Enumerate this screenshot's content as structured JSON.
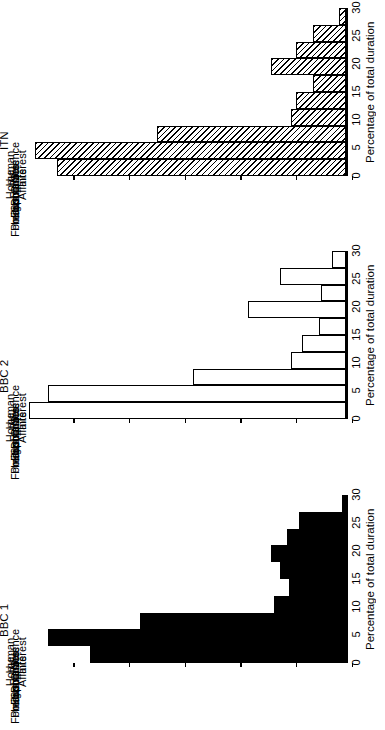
{
  "figure": {
    "orientation": "rotated-90",
    "value_axis_title": "Percentage of total duration",
    "tick_labels": [
      "0",
      "5",
      "10",
      "15",
      "20",
      "25",
      "30"
    ],
    "tick_values": [
      0,
      5,
      10,
      15,
      20,
      25,
      30
    ],
    "axis_max": 30,
    "categories": [
      "Science",
      "Human\nInterest",
      "Crime",
      "Home\nAffairs",
      "Disasters",
      "Sport",
      "Economics",
      "Industrial",
      "Politics",
      "Foreign"
    ]
  },
  "panels": [
    {
      "title": "ITN",
      "fill": "hatch",
      "color": "#000000"
    },
    {
      "title": "BBC 2",
      "fill": "open",
      "color": "#000000"
    },
    {
      "title": "BBC 1",
      "fill": "solid",
      "color": "#000000"
    }
  ],
  "chart_data": {
    "type": "bar",
    "title": "",
    "subtitle": "",
    "xlabel": "",
    "ylabel": "Percentage of total duration",
    "ylim": [
      0,
      30
    ],
    "yticks": [
      0,
      5,
      10,
      15,
      20,
      25,
      30
    ],
    "grid": false,
    "legend": "none",
    "orientation": "horizontal-rotated",
    "panels": [
      "ITN",
      "BBC 2",
      "BBC 1"
    ],
    "categories": [
      "Science",
      "Human Interest",
      "Crime",
      "Home Affairs",
      "Disasters",
      "Sport",
      "Economics",
      "Industrial",
      "Politics",
      "Foreign"
    ],
    "series": [
      {
        "name": "ITN",
        "fill": "hatched",
        "values": [
          0.7,
          3.0,
          4.5,
          6.8,
          3.0,
          4.5,
          5.0,
          17.0,
          28.0,
          26.0
        ]
      },
      {
        "name": "BBC 2",
        "fill": "open",
        "values": [
          1.3,
          6.0,
          2.3,
          8.8,
          2.5,
          4.0,
          5.0,
          13.8,
          26.8,
          28.5
        ]
      },
      {
        "name": "BBC 1",
        "fill": "solid",
        "values": [
          0.4,
          4.3,
          5.3,
          6.8,
          6.0,
          5.2,
          6.5,
          18.5,
          26.8,
          23.0
        ]
      }
    ]
  }
}
